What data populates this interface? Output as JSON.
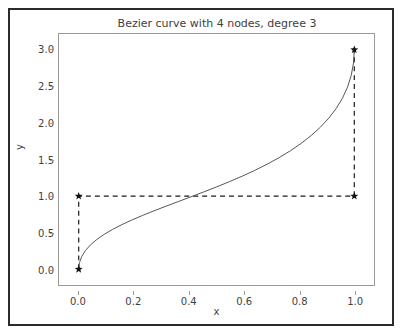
{
  "figure": {
    "title": "Bezier curve with 4 nodes, degree 3",
    "background_color": "#ffffff",
    "border_color": "#2b2b2b",
    "axes_edge_color": "#9a9a9a"
  },
  "chart_data": {
    "type": "line",
    "title": "Bezier curve with 4 nodes, degree 3",
    "xlabel": "x",
    "ylabel": "y",
    "xlim": [
      -0.0715,
      1.0715
    ],
    "ylim": [
      -0.215,
      3.215
    ],
    "xticks": [
      0.0,
      0.2,
      0.4,
      0.6,
      0.8,
      1.0
    ],
    "xtick_labels": [
      "0.0",
      "0.2",
      "0.4",
      "0.6",
      "0.8",
      "1.0"
    ],
    "yticks": [
      0.0,
      0.5,
      1.0,
      1.5,
      2.0,
      2.5,
      3.0
    ],
    "ytick_labels": [
      "0.0",
      "0.5",
      "1.0",
      "1.5",
      "2.0",
      "2.5",
      "3.0"
    ],
    "grid": false,
    "legend": null,
    "series": [
      {
        "name": "bezier-curve",
        "kind": "bezier",
        "degree": 3,
        "color": "#555555",
        "linewidth": 1.0,
        "linestyle": "solid",
        "control_points": [
          [
            0.0,
            0.0
          ],
          [
            0.0,
            1.0
          ],
          [
            1.0,
            1.0
          ],
          [
            1.0,
            3.0
          ]
        ],
        "x": [
          0.0,
          0.05,
          0.1,
          0.15,
          0.2,
          0.25,
          0.3,
          0.35,
          0.4,
          0.45,
          0.5,
          0.55,
          0.6,
          0.65,
          0.7,
          0.75,
          0.8,
          0.85,
          0.9,
          0.95,
          1.0
        ],
        "y": [
          0.0,
          0.348,
          0.47,
          0.556,
          0.627,
          0.689,
          0.746,
          0.8,
          0.852,
          0.903,
          0.954,
          1.006,
          1.06,
          1.117,
          1.178,
          1.247,
          1.327,
          1.425,
          1.559,
          1.79,
          3.0
        ]
      },
      {
        "name": "control-polygon",
        "kind": "dashed-polyline",
        "color": "#1a1a1a",
        "linewidth": 1.2,
        "linestyle": "dashed",
        "marker": "star",
        "points": [
          [
            0.0,
            0.0
          ],
          [
            0.0,
            1.0
          ],
          [
            1.0,
            1.0
          ],
          [
            1.0,
            3.0
          ]
        ]
      }
    ],
    "nodes": [
      {
        "label": "node-0",
        "x": 0.0,
        "y": 0.0
      },
      {
        "label": "node-1",
        "x": 0.0,
        "y": 1.0
      },
      {
        "label": "node-2",
        "x": 1.0,
        "y": 1.0
      },
      {
        "label": "node-3",
        "x": 1.0,
        "y": 3.0
      }
    ]
  }
}
